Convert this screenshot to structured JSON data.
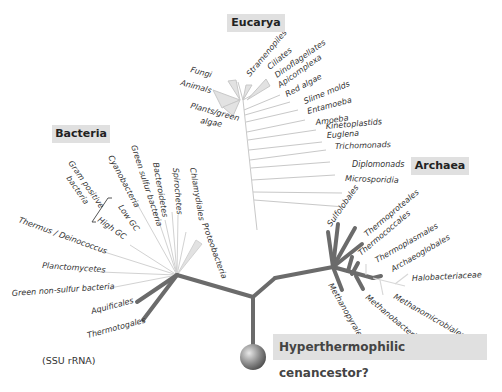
{
  "figure": {
    "domains": {
      "eucarya": "Eucarya",
      "bacteria": "Bacteria",
      "archaea": "Archaea"
    },
    "eucarya_taxa": [
      "Fungi",
      "Animals",
      "Plants/green",
      "algae",
      "Stramenopiles",
      "Ciliates",
      "Dinoflagellates",
      "Apicomplexa",
      "Red algae",
      "Slime molds",
      "Entamoeba",
      "Amoeba",
      "Kinetoplastids",
      "Euglena",
      "Trichomonads",
      "Diplomonads",
      "Microsporidia"
    ],
    "bacteria_taxa": [
      "Gram positive",
      "bacteria",
      "Cyanobacteria",
      "Green sulfur bacteria",
      "Bacteroidetes",
      "Spirochetes",
      "Chlamydiales",
      "Low GC",
      "High GC",
      "Thermus / Deinococcus",
      "Proteobacteria",
      "Planctomycetes",
      "Green non-sulfur bacteria",
      "Aquificales",
      "Thermotogales"
    ],
    "archaea_taxa": [
      "Sulfolobales",
      "Thermoproteales",
      "Thermococcales",
      "Thermoplasmales",
      "Archaeoglobales",
      "Halobacteriaceae",
      "Methanopyrales",
      "Methanobacteriales",
      "Methanomicrobiales"
    ],
    "caption_ssu": "(SSU rRNA)",
    "root_label": "Hyperthermophilic cenancestor?",
    "colors": {
      "thermophile_branch": "#6b6b6b",
      "mesophile_branch": "#c8c8c8",
      "label_box": "#e0e0e0",
      "text": "#333333"
    }
  }
}
